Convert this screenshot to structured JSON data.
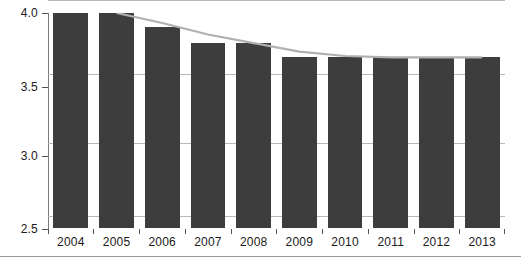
{
  "chart_data": {
    "type": "bar",
    "title": "",
    "subtitle": "",
    "xlabel": "",
    "ylabel": "",
    "categories": [
      "2004",
      "2005",
      "2006",
      "2007",
      "2008",
      "2009",
      "2010",
      "2011",
      "2012",
      "2013"
    ],
    "values": [
      4.0,
      4.0,
      3.9,
      3.79,
      3.79,
      3.69,
      3.69,
      3.69,
      3.69,
      3.69
    ],
    "ylim": [
      2.5,
      4.0
    ],
    "yticks": [
      "2.5",
      "3.0",
      "3.5",
      "4.0"
    ],
    "ytick_values": [
      2.5,
      3.0,
      3.5,
      4.0
    ],
    "grid": true,
    "legend": "none",
    "bar_color": "#3d3d3d",
    "series": [
      {
        "name": "bars",
        "type": "bar",
        "values": [
          4.0,
          4.0,
          3.9,
          3.79,
          3.79,
          3.69,
          3.69,
          3.69,
          3.69,
          3.69
        ]
      },
      {
        "name": "trend-line",
        "type": "line",
        "color": "#b0b0b0",
        "x": [
          "2005",
          "2006",
          "2007",
          "2008",
          "2009",
          "2010",
          "2011",
          "2012",
          "2013"
        ],
        "values": [
          4.0,
          3.93,
          3.85,
          3.79,
          3.73,
          3.7,
          3.69,
          3.69,
          3.69
        ]
      }
    ]
  },
  "colors": {
    "bar": "#3d3d3d",
    "trend_line": "#b0b0b0",
    "grid": "#b8b8b8",
    "axis": "#7a7a7a",
    "text": "#1a1a1a",
    "footer_rule": "#9a9a9a"
  }
}
